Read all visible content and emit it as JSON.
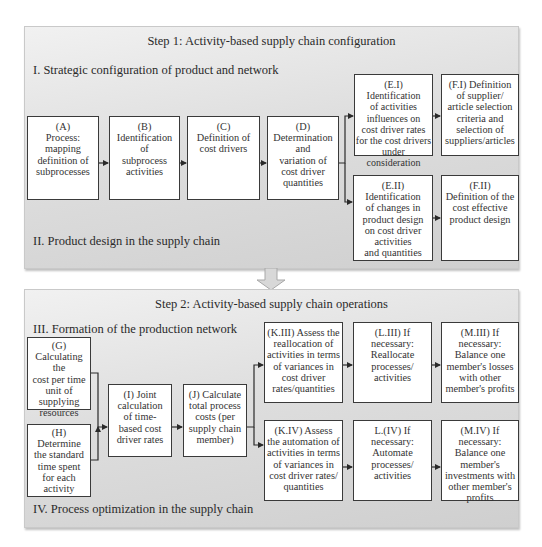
{
  "step1": {
    "title": "Step 1: Activity-based supply chain configuration",
    "section_i": "I. Strategic configuration of product and network",
    "section_ii": "II. Product design in the supply chain",
    "boxes": {
      "A": [
        "(A)",
        "Process:",
        "mapping",
        "definition of",
        "subprocesses"
      ],
      "B": [
        "(B)",
        "Identification",
        "of",
        "subprocess",
        "activities"
      ],
      "C": [
        "(C)",
        "Definition of",
        "cost drivers"
      ],
      "D": [
        "(D)",
        "Determination",
        "and",
        "variation of",
        "cost driver",
        "quantities"
      ],
      "EI": [
        "(E.I)",
        "Identification",
        "of activities",
        "influences on",
        "cost driver rates",
        "for the cost drivers",
        "under consideration"
      ],
      "FI": [
        "(F.I) Definition",
        "of supplier/",
        "article selection",
        "criteria and",
        "selection of",
        "suppliers/articles"
      ],
      "EII": [
        "(E.II)",
        "Identification",
        "of changes in",
        "product design",
        "on cost driver",
        "activities",
        "and quantities"
      ],
      "FII": [
        "(F.II)",
        "Definition of the",
        "cost effective",
        "product design"
      ]
    }
  },
  "step2": {
    "title": "Step 2: Activity-based supply chain operations",
    "section_iii": "III. Formation of the production network",
    "section_iv": "IV. Process optimization in the supply chain",
    "boxes": {
      "G": [
        "(G)",
        "Calculating the",
        "cost per time",
        "unit of",
        "supplying",
        "resources"
      ],
      "H": [
        "(H)",
        "Determine",
        "the standard",
        "time spent",
        "for each",
        "activity"
      ],
      "I": [
        "(I) Joint",
        "calculation",
        "of time-",
        "based cost",
        "driver rates"
      ],
      "J": [
        "(J) Calculate",
        "total process",
        "costs (per",
        "supply chain",
        "member)"
      ],
      "KIII": [
        "(K.III) Assess the",
        "reallocation of",
        "activities in terms",
        "of variances in",
        "cost driver",
        "rates/quantities"
      ],
      "LIII": [
        "(L.III) If",
        "necessary:",
        "Reallocate",
        "processes/",
        "activities"
      ],
      "MIII": [
        "(M.III) If",
        "necessary:",
        "Balance one",
        "member's losses",
        "with other",
        "member's profits"
      ],
      "KIV": [
        "(K.IV) Assess",
        "the automation of",
        "activities in terms",
        "of variances in",
        "cost driver rates/",
        "quantities"
      ],
      "LIV": [
        "L.(IV) If",
        "necessary:",
        "Automate",
        "processes/",
        "activities"
      ],
      "MIV": [
        "(M.IV) If",
        "necessary:",
        "Balance one",
        "member's",
        "investments with",
        "other member's",
        "profits"
      ]
    }
  },
  "colors": {
    "panel_light": "#f1f1f1",
    "panel_dark": "#cfcfcf",
    "box_border": "#3a3a3a",
    "arrow": "#2a2a2a",
    "transition_arrow": "#d6d6d6"
  }
}
